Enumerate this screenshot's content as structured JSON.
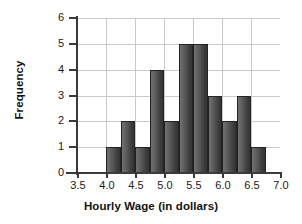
{
  "chart_data": {
    "type": "bar",
    "title": "",
    "subtitle": "",
    "xlabel": "Hourly Wage (in dollars)",
    "ylabel": "Frequency",
    "xlim": [
      3.5,
      7.0
    ],
    "ylim": [
      0,
      6
    ],
    "xticks": [
      "3.5",
      "4.0",
      "4.5",
      "5.0",
      "5.5",
      "6.0",
      "6.5",
      "7.0"
    ],
    "xtick_values": [
      3.5,
      4.0,
      4.5,
      5.0,
      5.5,
      6.0,
      6.5,
      7.0
    ],
    "yticks": [
      "0",
      "1",
      "2",
      "3",
      "4",
      "5",
      "6"
    ],
    "ytick_values": [
      0,
      1,
      2,
      3,
      4,
      5,
      6
    ],
    "grid": true,
    "legend": "none",
    "bin_width": 0.25,
    "bin_starts": [
      4.0,
      4.25,
      4.5,
      4.75,
      5.0,
      5.25,
      5.5,
      5.75,
      6.0,
      6.25,
      6.5
    ],
    "bin_ends": [
      4.25,
      4.5,
      4.75,
      5.0,
      5.25,
      5.5,
      5.75,
      6.0,
      6.25,
      6.5,
      6.75
    ],
    "categories": [
      "4.00-4.25",
      "4.25-4.50",
      "4.50-4.75",
      "4.75-5.00",
      "5.00-5.25",
      "5.25-5.50",
      "5.50-5.75",
      "5.75-6.00",
      "6.00-6.25",
      "6.25-6.50",
      "6.50-6.75"
    ],
    "values": [
      1,
      2,
      1,
      4,
      2,
      5,
      5,
      3,
      2,
      3,
      1
    ],
    "bar_color": "#4a4a4a",
    "bar_edge_color": "#232323",
    "grid_color": "#c9c9c9",
    "axis_color": "#3a3a3a",
    "total_count": 29
  }
}
